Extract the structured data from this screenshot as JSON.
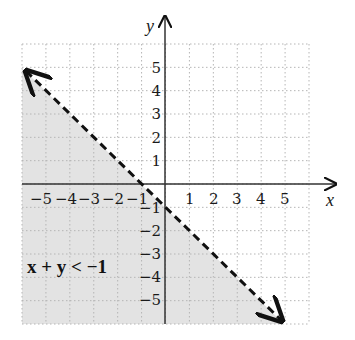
{
  "chart_data": {
    "type": "line",
    "title": "",
    "xlabel": "x",
    "ylabel": "y",
    "xlim": [
      -6,
      6
    ],
    "ylim": [
      -6,
      6
    ],
    "grid": true,
    "x_ticks": [
      "-5",
      "-4",
      "-3",
      "-2",
      "-1",
      "1",
      "2",
      "3",
      "4",
      "5"
    ],
    "y_ticks": [
      "5",
      "4",
      "3",
      "2",
      "1",
      "-1",
      "-2",
      "-3",
      "-4",
      "-5"
    ],
    "boundary_line": {
      "equation": "x + y = -1",
      "style": "dashed",
      "points": [
        [
          -6,
          5
        ],
        [
          5,
          -6
        ]
      ],
      "arrows": "both ends"
    },
    "shaded_region": "below-left of line (x + y < -1)",
    "annotation": "x + y < −1",
    "colors": {
      "shade": "#e3e3e3",
      "grid": "#b5b5b5",
      "axes": "#333333",
      "line": "#111111"
    }
  }
}
